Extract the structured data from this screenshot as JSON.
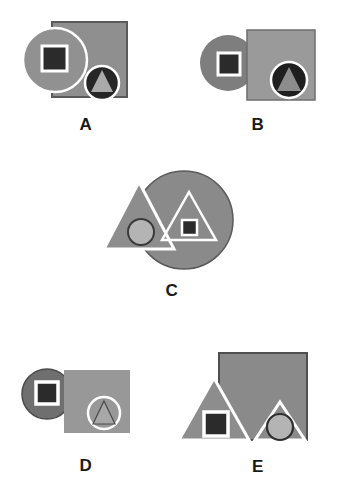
{
  "figure": {
    "type": "abstract-shape-panels",
    "background_color": "#ffffff",
    "panel_count": 5,
    "label_color": "#1a1a1a"
  },
  "palette": {
    "white": "#ffffff",
    "near_black": "#2b2b2b",
    "dark_gray": "#3a3a3a",
    "mid_dark_gray": "#6f6f6f",
    "mid_gray": "#8a8a8a",
    "gray": "#909090",
    "light_mid_gray": "#9a9a9a",
    "light_gray": "#b4b4b4",
    "outline_gray": "#5a5a5a"
  },
  "panels": [
    {
      "id": "a",
      "label": "A",
      "shapes": [
        {
          "name": "large-square",
          "kind": "square",
          "fill": "#8f8f8f",
          "stroke": "#5a5a5a",
          "z": 1
        },
        {
          "name": "large-circle",
          "kind": "circle",
          "fill": "#919191",
          "stroke": "#ffffff",
          "z": 2
        },
        {
          "name": "inner-square",
          "kind": "square",
          "fill": "#2b2b2b",
          "stroke": "#ffffff",
          "z": 3
        },
        {
          "name": "inner-circle",
          "kind": "circle",
          "fill": "#262626",
          "stroke": "#ffffff",
          "z": 3
        },
        {
          "name": "inner-triangle",
          "kind": "triangle",
          "fill": "#aaaaaa",
          "stroke": "none",
          "z": 4
        }
      ]
    },
    {
      "id": "b",
      "label": "B",
      "shapes": [
        {
          "name": "large-circle",
          "kind": "circle",
          "fill": "#7e7e7e",
          "stroke": "none",
          "z": 1
        },
        {
          "name": "large-square",
          "kind": "square",
          "fill": "#9a9a9a",
          "stroke": "#6e6e6e",
          "z": 2
        },
        {
          "name": "inner-square",
          "kind": "square",
          "fill": "#2b2b2b",
          "stroke": "#ffffff",
          "z": 3
        },
        {
          "name": "inner-circle",
          "kind": "circle",
          "fill": "#1f1f1f",
          "stroke": "#ffffff",
          "z": 3
        },
        {
          "name": "inner-triangle",
          "kind": "triangle",
          "fill": "#8c8c8c",
          "stroke": "none",
          "z": 4
        }
      ]
    },
    {
      "id": "c",
      "label": "C",
      "shapes": [
        {
          "name": "large-circle",
          "kind": "circle",
          "fill": "#8a8a8a",
          "stroke": "#5a5a5a",
          "z": 1
        },
        {
          "name": "large-triangle",
          "kind": "triangle",
          "fill": "#8d8d8d",
          "stroke": "#ffffff",
          "z": 2
        },
        {
          "name": "inner-circle",
          "kind": "circle",
          "fill": "#b4b4b4",
          "stroke": "#3a3a3a",
          "z": 3
        },
        {
          "name": "inner-triangle",
          "kind": "triangle",
          "fill": "none",
          "stroke": "#ffffff",
          "z": 3
        },
        {
          "name": "inner-square",
          "kind": "square",
          "fill": "#2b2b2b",
          "stroke": "#ffffff",
          "z": 4
        }
      ]
    },
    {
      "id": "d",
      "label": "D",
      "shapes": [
        {
          "name": "large-circle",
          "kind": "circle",
          "fill": "#6f6f6f",
          "stroke": "#4a4a4a",
          "z": 1
        },
        {
          "name": "inner-square",
          "kind": "square",
          "fill": "#2b2b2b",
          "stroke": "#ffffff",
          "z": 2
        },
        {
          "name": "large-square",
          "kind": "square",
          "fill": "#989898",
          "stroke": "none",
          "z": 3
        },
        {
          "name": "inner-circle",
          "kind": "circle",
          "fill": "none",
          "stroke": "#ffffff",
          "z": 4
        },
        {
          "name": "inner-triangle",
          "kind": "triangle",
          "fill": "#a8a8a8",
          "stroke": "#4a4a4a",
          "z": 5
        }
      ]
    },
    {
      "id": "e",
      "label": "E",
      "shapes": [
        {
          "name": "large-square",
          "kind": "square",
          "fill": "#8a8a8a",
          "stroke": "#4f4f4f",
          "z": 1
        },
        {
          "name": "large-triangle",
          "kind": "triangle",
          "fill": "#8d8d8d",
          "stroke": "#ffffff",
          "z": 2
        },
        {
          "name": "inner-square",
          "kind": "square",
          "fill": "#2b2b2b",
          "stroke": "#ffffff",
          "z": 3
        },
        {
          "name": "inner-triangle",
          "kind": "triangle",
          "fill": "none",
          "stroke": "#ffffff",
          "z": 3
        },
        {
          "name": "inner-circle",
          "kind": "circle",
          "fill": "#b4b4b4",
          "stroke": "#2f2f2f",
          "z": 4
        }
      ]
    }
  ]
}
